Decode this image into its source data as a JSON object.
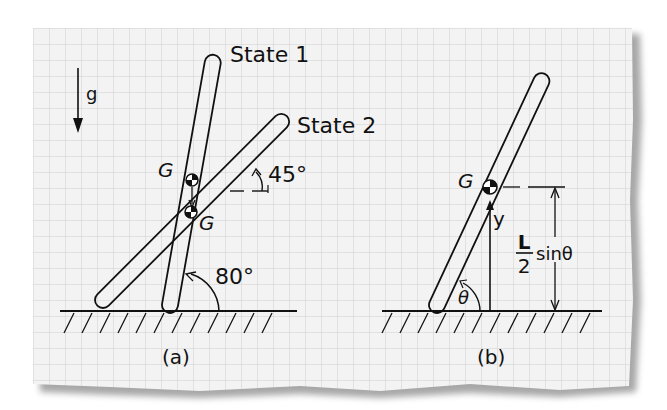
{
  "figure": {
    "panel_a": {
      "caption": "(a)",
      "gravity_label": "g",
      "state1_label": "State 1",
      "state2_label": "State 2",
      "com_label_state1": "G",
      "com_label_state2": "G",
      "angle_state1": "80°",
      "angle_state2": "45°"
    },
    "panel_b": {
      "caption": "(b)",
      "com_label": "G",
      "height_label": "y",
      "formula_numerator": "L",
      "formula_denominator": "2",
      "formula_suffix": "sinθ",
      "angle_label": "θ"
    }
  },
  "colors": {
    "ink": "#111111",
    "paper": "#f2f2f2",
    "grid": "#c9c9c9",
    "shadow": "#9a9a9a"
  }
}
